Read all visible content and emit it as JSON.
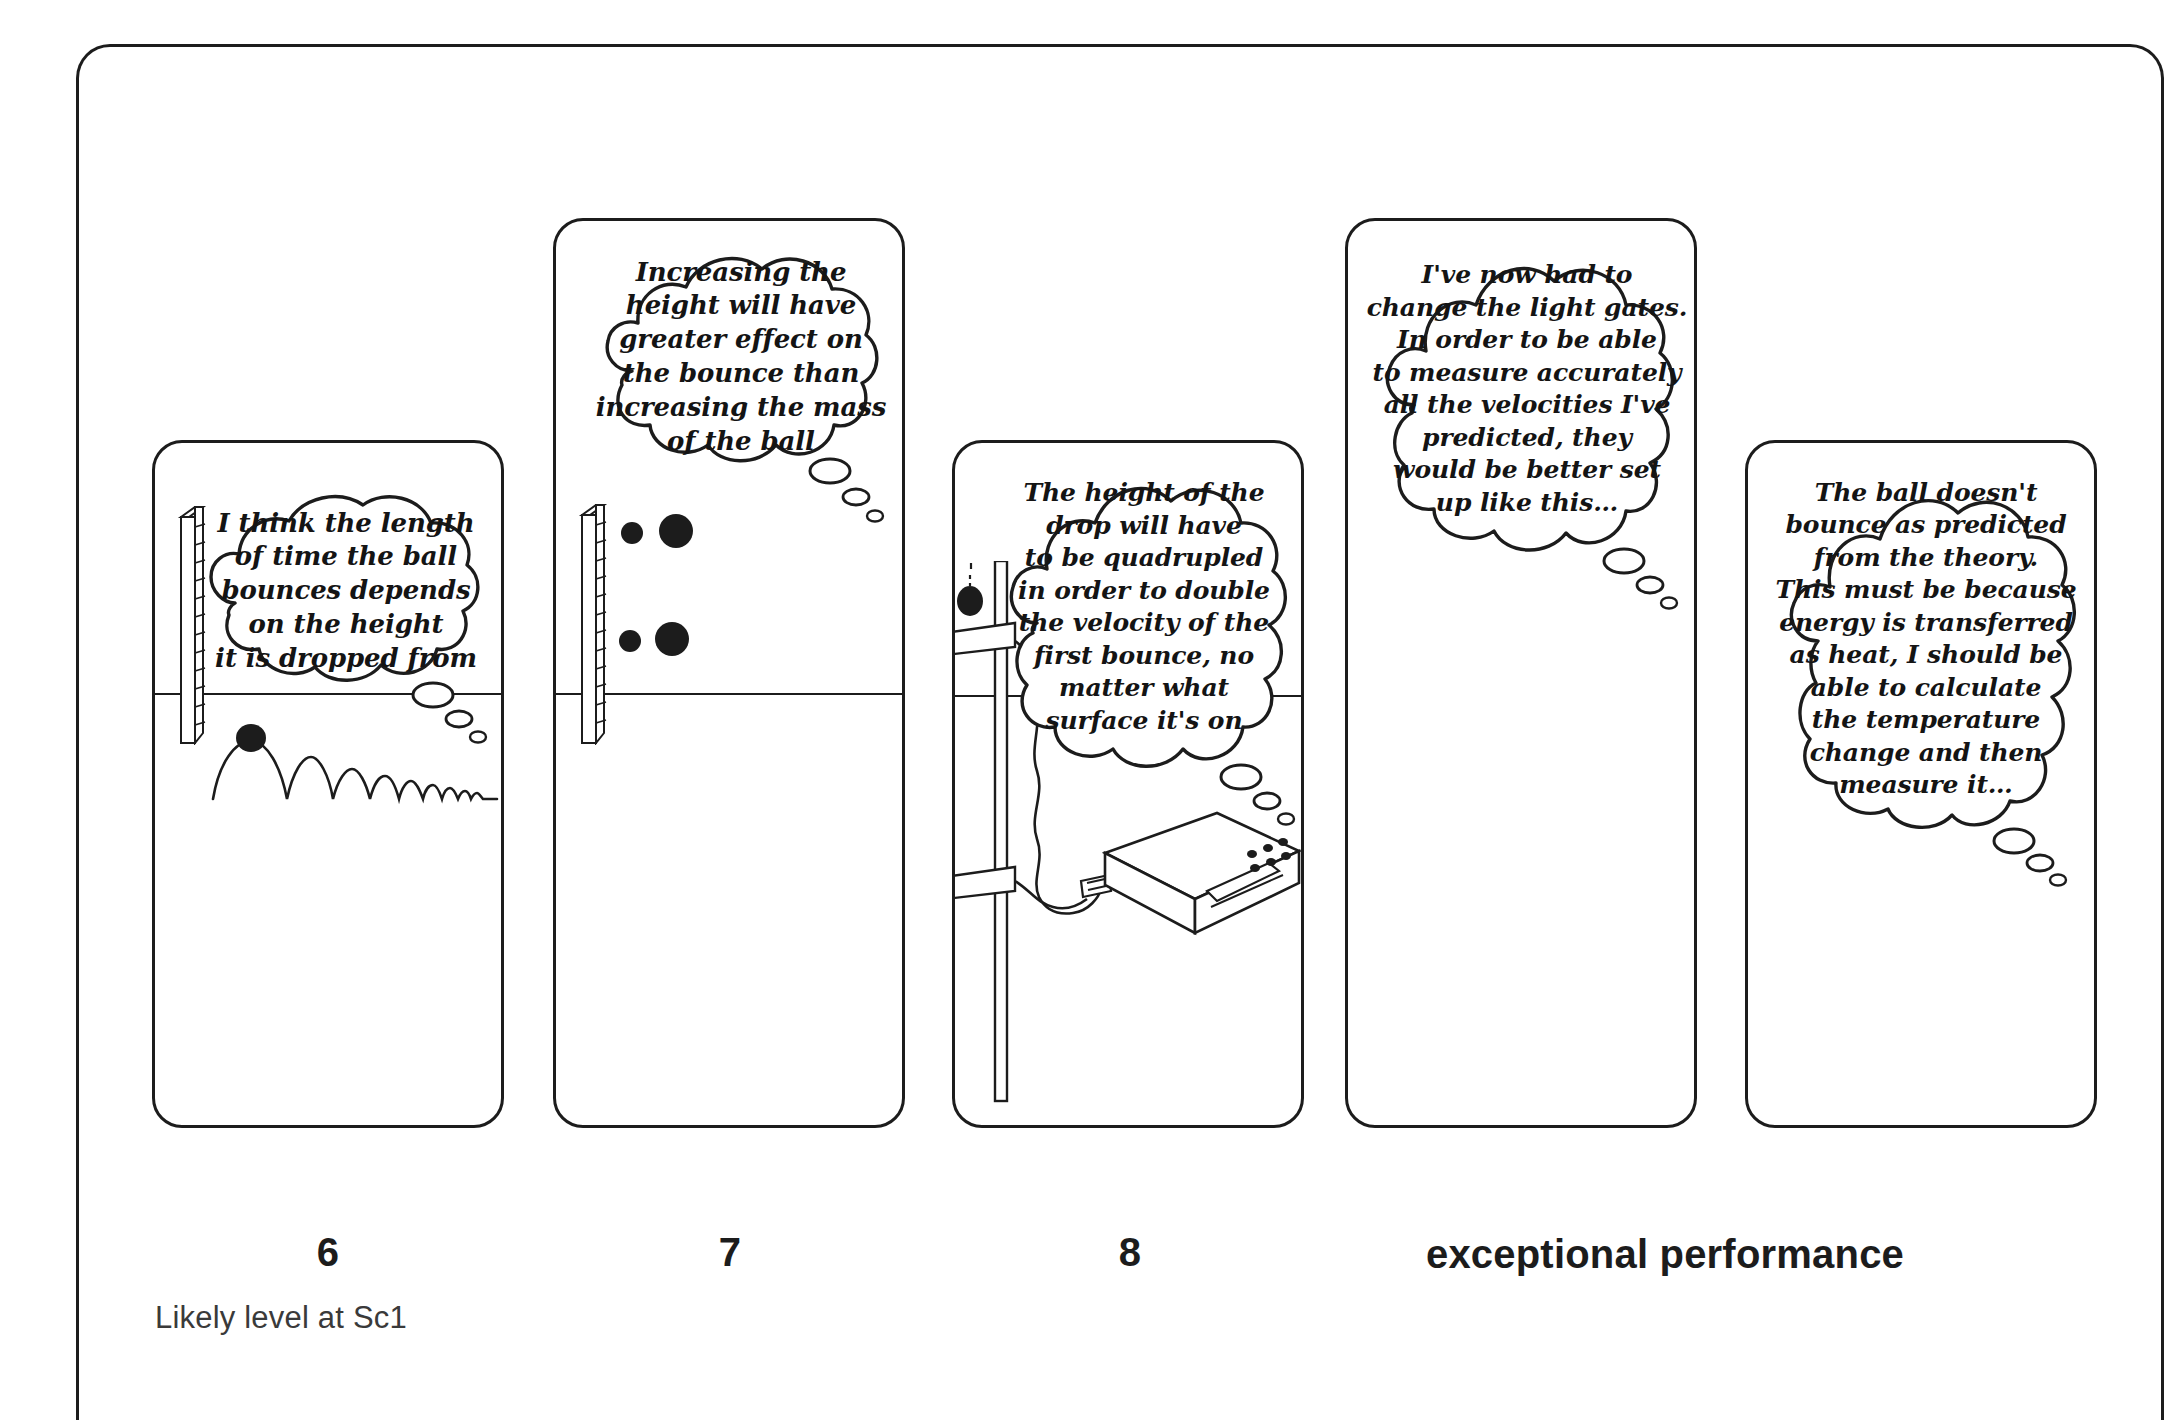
{
  "figure": {
    "title_note": "Likely level at Sc1",
    "levels": [
      {
        "label": "6",
        "center_x": 328
      },
      {
        "label": "7",
        "center_x": 730
      },
      {
        "label": "8",
        "center_x": 1130
      },
      {
        "label": "exceptional performance",
        "center_x": 1665
      }
    ]
  },
  "panels": [
    {
      "id": "panel-level-6",
      "level": "6",
      "x": 152,
      "y": 440,
      "w": 352,
      "h": 688,
      "bubble": {
        "x": 26,
        "y": 42,
        "w": 300,
        "h": 210,
        "font_size": 26,
        "lines": [
          "I think the length",
          "of time the ball",
          "bounces depends",
          "on the height",
          "it is dropped from"
        ],
        "tail": {
          "x": 250,
          "y": 250,
          "dir": "right"
        }
      },
      "illustration": "ruler-stopwatch-bouncing-ball"
    },
    {
      "id": "panel-level-7",
      "level": "7",
      "x": 553,
      "y": 218,
      "w": 352,
      "h": 910,
      "bubble": {
        "x": 30,
        "y": 20,
        "w": 290,
        "h": 232,
        "font_size": 26,
        "lines": [
          "Increasing the",
          "height will have",
          "greater effect on",
          "the bounce than",
          "increasing the mass",
          "of the ball"
        ],
        "tail": {
          "x": 240,
          "y": 230,
          "dir": "right"
        }
      },
      "illustration": "ruler-two-ball-pairs"
    },
    {
      "id": "panel-level-8",
      "level": "8",
      "x": 952,
      "y": 440,
      "w": 352,
      "h": 688,
      "bubble": {
        "x": 38,
        "y": 18,
        "w": 288,
        "h": 280,
        "font_size": 25,
        "lines": [
          "The height of the",
          "drop will have",
          "to be quadrupled",
          "in order to double",
          "the velocity of the",
          "first bounce, no",
          "matter what",
          "surface it's on"
        ],
        "tail": {
          "x": 245,
          "y": 282,
          "dir": "right"
        }
      },
      "illustration": "stand-light-gates-timer"
    },
    {
      "id": "panel-exceptional-a",
      "level": "exceptional performance",
      "x": 1345,
      "y": 218,
      "w": 352,
      "h": 910,
      "bubble": {
        "x": 24,
        "y": 22,
        "w": 300,
        "h": 278,
        "font_size": 25,
        "lines": [
          "I've now had to",
          "change the light gates.",
          "In order to be able",
          "to measure accurately",
          "all the velocities I've",
          "predicted, they",
          "would be better set",
          "up like this…"
        ],
        "tail": {
          "x": 232,
          "y": 275,
          "dir": "right"
        }
      },
      "illustration": "none"
    },
    {
      "id": "panel-exceptional-b",
      "level": "exceptional performance",
      "x": 1745,
      "y": 440,
      "w": 352,
      "h": 688,
      "bubble": {
        "x": 28,
        "y": 26,
        "w": 296,
        "h": 300,
        "font_size": 25,
        "lines": [
          "The ball doesn't",
          "bounce as predicted",
          "from the theory.",
          "This must be because",
          "energy is transferred",
          "as heat, I should be",
          "able to calculate",
          "the temperature",
          "change and then",
          "measure it…"
        ],
        "tail": {
          "x": 238,
          "y": 298,
          "dir": "right"
        }
      },
      "illustration": "none"
    }
  ],
  "colors": {
    "ink": "#1c1c1c",
    "paper": "#ffffff",
    "text": "#141414",
    "note": "#3a3a3a"
  }
}
